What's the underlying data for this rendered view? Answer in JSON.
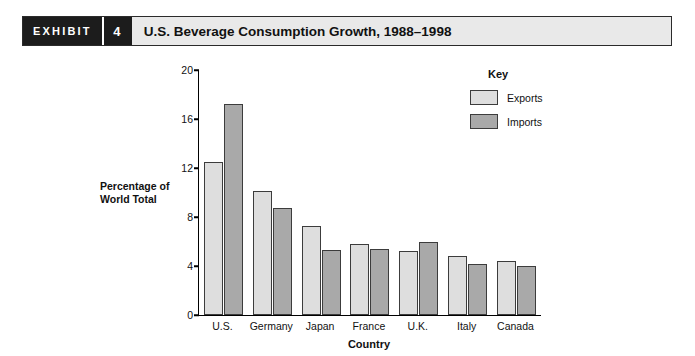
{
  "exhibit": {
    "tag": "EXHIBIT",
    "number": "4",
    "title": "U.S. Beverage Consumption Growth, 1988–1998"
  },
  "legend": {
    "title": "Key",
    "items": [
      {
        "label": "Exports",
        "color": "#dedede"
      },
      {
        "label": "Imports",
        "color": "#a9a9a9"
      }
    ]
  },
  "chart_data": {
    "type": "bar",
    "title": "U.S. Beverage Consumption Growth, 1988–1998",
    "categories": [
      "U.S.",
      "Germany",
      "Japan",
      "France",
      "U.K.",
      "Italy",
      "Canada"
    ],
    "series": [
      {
        "name": "Exports",
        "values": [
          12.5,
          10.1,
          7.3,
          5.8,
          5.2,
          4.8,
          4.4
        ]
      },
      {
        "name": "Imports",
        "values": [
          17.2,
          8.7,
          5.3,
          5.4,
          6.0,
          4.2,
          4.0
        ]
      }
    ],
    "xlabel": "Country",
    "ylabel": "Percentage of\nWorld Total",
    "ylabel_line1": "Percentage of",
    "ylabel_line2": "World Total",
    "ylim": [
      0,
      20
    ],
    "yticks": [
      0,
      4,
      8,
      12,
      16,
      20
    ],
    "grid": false,
    "legend_position": "top-right"
  }
}
